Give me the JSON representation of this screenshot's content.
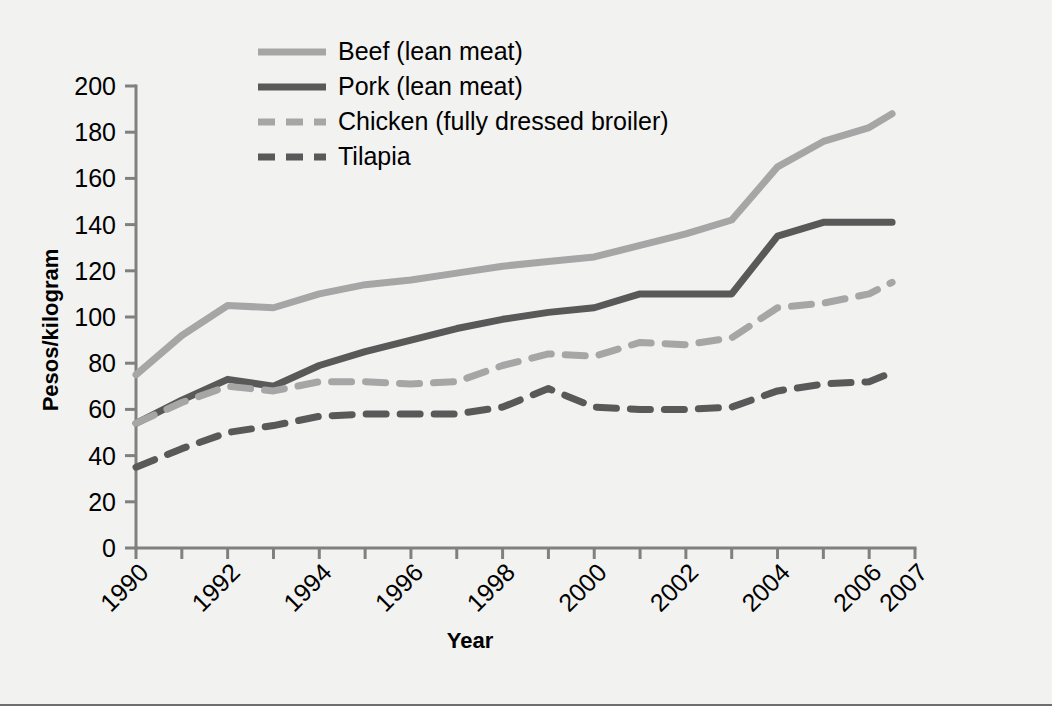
{
  "figure": {
    "background_color": "#f2f2f0",
    "plot_background_color": "#f2f2f0",
    "axis_color": "#808080",
    "rule_color": "#6e6e6e"
  },
  "chart_data": {
    "type": "line",
    "title": "",
    "xlabel": "Year",
    "ylabel": "Pesos/kilogram",
    "xlim": [
      1990,
      2007
    ],
    "ylim": [
      0,
      200
    ],
    "grid": false,
    "legend_position": "top-center",
    "x": [
      1990,
      1991,
      1992,
      1993,
      1994,
      1995,
      1996,
      1997,
      1998,
      1999,
      2000,
      2001,
      2002,
      2003,
      2004,
      2005,
      2006,
      2006.5
    ],
    "x_tick_labels": [
      "1990",
      "1992",
      "1994",
      "1996",
      "1998",
      "2000",
      "2002",
      "2004",
      "2006",
      "2007"
    ],
    "x_tick_values": [
      1990,
      1992,
      1994,
      1996,
      1998,
      2000,
      2002,
      2004,
      2006,
      2007
    ],
    "y_tick_labels": [
      "0",
      "20",
      "40",
      "60",
      "80",
      "100",
      "120",
      "140",
      "160",
      "180",
      "200"
    ],
    "y_tick_values": [
      0,
      20,
      40,
      60,
      80,
      100,
      120,
      140,
      160,
      180,
      200
    ],
    "series": [
      {
        "name": "Beef (lean meat)",
        "color": "#a6a6a6",
        "style": "solid",
        "width": 7,
        "values": [
          75,
          92,
          105,
          104,
          110,
          114,
          116,
          119,
          122,
          124,
          126,
          131,
          136,
          142,
          165,
          176,
          182,
          188
        ]
      },
      {
        "name": "Pork (lean meat)",
        "color": "#595959",
        "style": "solid",
        "width": 7,
        "values": [
          54,
          64,
          73,
          70,
          79,
          85,
          90,
          95,
          99,
          102,
          104,
          110,
          110,
          110,
          135,
          141,
          141,
          141
        ]
      },
      {
        "name": "Chicken (fully dressed broiler)",
        "color": "#a6a6a6",
        "style": "dashed",
        "width": 7,
        "values": [
          54,
          63,
          70,
          68,
          72,
          72,
          71,
          72,
          79,
          84,
          83,
          89,
          88,
          91,
          104,
          106,
          110,
          115
        ]
      },
      {
        "name": "Tilapia",
        "color": "#595959",
        "style": "dashed",
        "width": 7,
        "values": [
          35,
          43,
          50,
          53,
          57,
          58,
          58,
          58,
          61,
          69,
          61,
          60,
          60,
          61,
          68,
          71,
          72,
          76
        ]
      }
    ]
  }
}
